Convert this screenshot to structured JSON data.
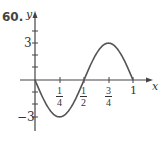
{
  "problem_number": "60.",
  "chart_data": {
    "type": "line",
    "title": "",
    "xlabel": "x",
    "ylabel": "y",
    "function": "y = -3 sin(2πx)",
    "xlim": [
      0,
      1
    ],
    "ylim": [
      -3,
      3
    ],
    "x_ticks": [
      "1/4",
      "1/2",
      "3/4",
      "1"
    ],
    "y_ticks": [
      "3",
      "−3"
    ],
    "grid": false,
    "legend": null,
    "series": [
      {
        "name": "curve",
        "x": [
          0,
          0.125,
          0.25,
          0.375,
          0.5,
          0.625,
          0.75,
          0.875,
          1
        ],
        "values": [
          0,
          -2.12,
          -3,
          -2.12,
          0,
          2.12,
          3,
          2.12,
          0
        ]
      }
    ],
    "colors": {
      "curve": "#555555",
      "axes": "#444444"
    }
  },
  "labels": {
    "x_axis": "x",
    "y_axis": "y",
    "y_tick_pos": "3",
    "y_tick_neg": "−3",
    "x_ticks": [
      {
        "num": "1",
        "den": "4"
      },
      {
        "num": "1",
        "den": "2"
      },
      {
        "num": "3",
        "den": "4"
      },
      {
        "num": "1",
        "den": ""
      }
    ]
  }
}
